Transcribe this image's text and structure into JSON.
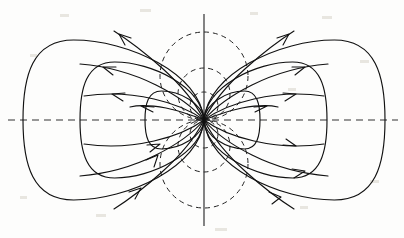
{
  "figure": {
    "background_color": "#fdfdfc",
    "line_color": "#111111",
    "axis_color": "#333333",
    "dash_color": "#222222"
  },
  "chart_data": {
    "type": "line",
    "xlabel": "",
    "ylabel": "",
    "grid": false,
    "legend_position": "none",
    "center": {
      "x": 204,
      "y": 120
    },
    "xlim": [
      0,
      404
    ],
    "ylim": [
      0,
      238
    ],
    "axes": [
      {
        "name": "vertical-axis",
        "style": "solid",
        "x1": 204,
        "y1": 14,
        "x2": 204,
        "y2": 226
      },
      {
        "name": "horizontal-axis",
        "style": "dashed",
        "x1": 8,
        "y1": 120,
        "x2": 398,
        "y2": 120
      }
    ],
    "field_line_loops": [
      {
        "side": "left",
        "apex_x": 23,
        "half_height": 80
      },
      {
        "side": "left",
        "apex_x": 80,
        "half_height": 58
      },
      {
        "side": "left",
        "apex_x": 145,
        "half_height": 29
      },
      {
        "side": "right",
        "apex_x": 385,
        "half_height": 80
      },
      {
        "side": "right",
        "apex_x": 327,
        "half_height": 58
      },
      {
        "side": "right",
        "apex_x": 260,
        "half_height": 29
      }
    ],
    "equipotential_circles": [
      {
        "center_x": 204,
        "center_y": 76,
        "radius": 44
      },
      {
        "center_x": 204,
        "center_y": 94,
        "radius": 26
      },
      {
        "center_x": 204,
        "center_y": 106,
        "radius": 14
      },
      {
        "center_x": 204,
        "center_y": 164,
        "radius": 44
      },
      {
        "center_x": 204,
        "center_y": 146,
        "radius": 26
      },
      {
        "center_x": 204,
        "center_y": 134,
        "radius": 14
      }
    ],
    "open_curves": [
      {
        "quadrant": "upper-left",
        "arrow_direction": "outward-up-left",
        "count": 4
      },
      {
        "quadrant": "upper-right",
        "arrow_direction": "outward-up-right",
        "count": 4
      },
      {
        "quadrant": "lower-left",
        "arrow_direction": "inward-up-right",
        "count": 3
      },
      {
        "quadrant": "lower-right",
        "arrow_direction": "outward-down-right",
        "count": 3
      }
    ],
    "arrow_count": 14
  }
}
